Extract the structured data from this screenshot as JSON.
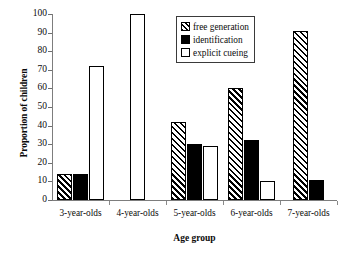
{
  "chart_data": {
    "type": "bar",
    "title": "",
    "xlabel": "Age group",
    "ylabel": "Proportion of children",
    "categories": [
      "3-year-olds",
      "4-year-olds",
      "5-year-olds",
      "6-year-olds",
      "7-year-olds"
    ],
    "series": [
      {
        "name": "free generation",
        "values": [
          14,
          0,
          42,
          60,
          91
        ],
        "style": "hatched"
      },
      {
        "name": "identification",
        "values": [
          14,
          0,
          30,
          32,
          11
        ],
        "style": "solid-black"
      },
      {
        "name": "explicit cueing",
        "values": [
          72,
          100,
          29,
          10,
          0
        ],
        "style": "white-outline"
      }
    ],
    "ylim": [
      0,
      100
    ],
    "ytick_values": [
      0,
      10,
      20,
      30,
      40,
      50,
      60,
      70,
      80,
      90,
      100
    ],
    "ytick_labels": [
      "0",
      "10",
      "20",
      "30",
      "40",
      "50",
      "60",
      "70",
      "80",
      "90",
      "100"
    ],
    "grid": false,
    "legend_position": "top-right",
    "colors": {
      "bar_outline": "#000000",
      "identification_fill": "#000000",
      "explicit_cueing_fill": "#ffffff",
      "axis": "#7d7d7d",
      "text": "#0b0b0b"
    }
  },
  "legend": {
    "entries": [
      {
        "label": "free generation"
      },
      {
        "label": "identification"
      },
      {
        "label": "explicit cueing"
      }
    ]
  }
}
